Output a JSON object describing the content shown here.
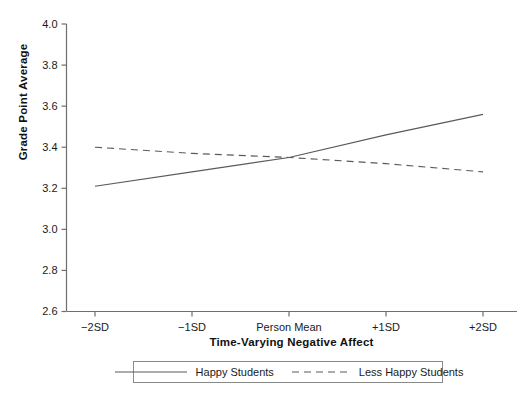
{
  "chart_data": {
    "type": "line",
    "title": "",
    "xlabel": "Time-Varying Negative Affect",
    "ylabel": "Grade Point Average",
    "categories": [
      "-2SD",
      "-1SD",
      "Person Mean",
      "+1SD",
      "+2SD"
    ],
    "x": [
      -2,
      -1,
      0,
      1,
      2
    ],
    "ylim": [
      2.6,
      4.0
    ],
    "yticks": [
      "2.6",
      "2.8",
      "3.0",
      "3.2",
      "3.4",
      "3.6",
      "3.8",
      "4.0"
    ],
    "ytick_values": [
      2.6,
      2.8,
      3.0,
      3.2,
      3.4,
      3.6,
      3.8,
      4.0
    ],
    "xticks": [
      "−2SD",
      "−1SD",
      "Person Mean",
      "+1SD",
      "+2SD"
    ],
    "grid": false,
    "legend_position": "bottom",
    "series": [
      {
        "name": "Happy Students",
        "style": "solid",
        "color": "#5a5a5a",
        "values": [
          3.21,
          3.28,
          3.35,
          3.46,
          3.56
        ]
      },
      {
        "name": "Less Happy Students",
        "style": "dashed",
        "color": "#5a5a5a",
        "values": [
          3.4,
          3.37,
          3.35,
          3.32,
          3.28
        ]
      }
    ]
  },
  "legend": {
    "entries": [
      {
        "label": "Happy Students",
        "style": "solid"
      },
      {
        "label": "Less Happy Students",
        "style": "dashed"
      }
    ]
  },
  "axis": {
    "y_label": "Grade Point Average",
    "x_label": "Time-Varying Negative Affect"
  },
  "colors": {
    "line": "#5a5a5a",
    "axis": "#6e6e6e",
    "text": "#1a1a1a",
    "background": "#ffffff"
  }
}
